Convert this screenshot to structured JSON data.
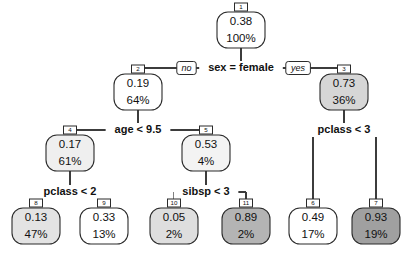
{
  "chart_data": {
    "type": "diagram",
    "diagram_type": "decision-tree",
    "title": "",
    "root_id": "1",
    "nodes": [
      {
        "id": "1",
        "label": "1",
        "value": "0.38",
        "percent": "100%",
        "fill": "#ffffff",
        "kind": "internal",
        "x": 241,
        "y": 30
      },
      {
        "id": "2",
        "label": "2",
        "value": "0.19",
        "percent": "64%",
        "fill": "#ffffff",
        "kind": "internal",
        "x": 138,
        "y": 92
      },
      {
        "id": "3",
        "label": "3",
        "value": "0.73",
        "percent": "36%",
        "fill": "#d6d6d6",
        "kind": "internal",
        "x": 344,
        "y": 92
      },
      {
        "id": "4",
        "label": "4",
        "value": "0.17",
        "percent": "61%",
        "fill": "#efefef",
        "kind": "internal",
        "x": 70,
        "y": 153
      },
      {
        "id": "5",
        "label": "5",
        "value": "0.53",
        "percent": "4%",
        "fill": "#f3f3f3",
        "kind": "internal",
        "x": 206,
        "y": 153
      },
      {
        "id": "8",
        "label": "8",
        "value": "0.13",
        "percent": "47%",
        "fill": "#e3e3e3",
        "kind": "leaf",
        "x": 36,
        "y": 226
      },
      {
        "id": "9",
        "label": "9",
        "value": "0.33",
        "percent": "13%",
        "fill": "#ffffff",
        "kind": "leaf",
        "x": 104,
        "y": 226
      },
      {
        "id": "10",
        "label": "10",
        "value": "0.05",
        "percent": "2%",
        "fill": "#dedede",
        "kind": "leaf",
        "x": 174,
        "y": 226
      },
      {
        "id": "11",
        "label": "11",
        "value": "0.89",
        "percent": "2%",
        "fill": "#b4b4b4",
        "kind": "leaf",
        "x": 246,
        "y": 226
      },
      {
        "id": "6",
        "label": "6",
        "value": "0.49",
        "percent": "17%",
        "fill": "#ffffff",
        "kind": "leaf",
        "x": 313,
        "y": 226
      },
      {
        "id": "7",
        "label": "7",
        "value": "0.93",
        "percent": "19%",
        "fill": "#a0a0a0",
        "kind": "leaf",
        "x": 376,
        "y": 226
      }
    ],
    "splits": [
      {
        "id": "split-1",
        "text": "sex = female",
        "x": 241,
        "y": 68,
        "left_branch": "no",
        "right_branch": "yes",
        "parent": "1",
        "children": [
          "2",
          "3"
        ]
      },
      {
        "id": "split-2",
        "text": "age < 9.5",
        "x": 138,
        "y": 130,
        "left_branch": "",
        "right_branch": "",
        "parent": "2",
        "children": [
          "4",
          "5"
        ]
      },
      {
        "id": "split-3",
        "text": "pclass < 3",
        "x": 344,
        "y": 130,
        "left_branch": "",
        "right_branch": "",
        "parent": "3",
        "children": [
          "6",
          "7"
        ]
      },
      {
        "id": "split-4",
        "text": "pclass < 2",
        "x": 70,
        "y": 192,
        "left_branch": "",
        "right_branch": "",
        "parent": "4",
        "children": [
          "8",
          "9"
        ]
      },
      {
        "id": "split-5",
        "text": "sibsp < 3",
        "x": 206,
        "y": 192,
        "left_branch": "",
        "right_branch": "",
        "parent": "5",
        "children": [
          "10",
          "11"
        ]
      }
    ],
    "branch_labels": {
      "left": "no",
      "right": "yes"
    },
    "colors": {
      "stroke": "#2b2b2b",
      "edge": "#3c3c3c",
      "background": "#ffffff",
      "min_fill": "#ffffff",
      "max_fill": "#a0a0a0"
    },
    "legend": []
  }
}
